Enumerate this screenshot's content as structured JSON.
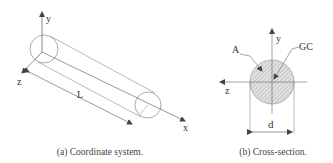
{
  "figure": {
    "panels": [
      {
        "id": "a",
        "caption": "(a) Coordinate system.",
        "labels": {
          "y_axis": "y",
          "z_axis": "z",
          "x_axis": "x",
          "length": "L"
        }
      },
      {
        "id": "b",
        "caption": "(b) Cross-section.",
        "labels": {
          "y_axis": "y",
          "z_axis": "z",
          "area": "A",
          "centroid": "GC",
          "diameter": "d"
        }
      }
    ]
  }
}
